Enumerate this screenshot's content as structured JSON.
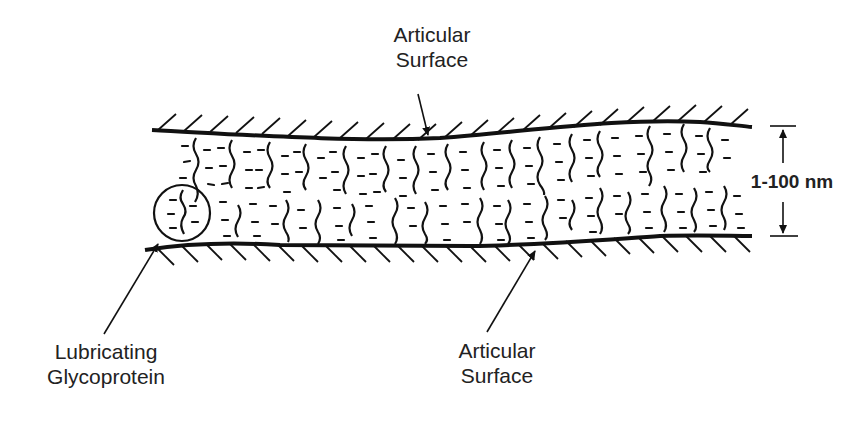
{
  "diagram": {
    "type": "schematic cross-section",
    "labels": {
      "top_surface": {
        "line1": "Articular",
        "line2": "Surface"
      },
      "bottom_surface": {
        "line1": "Articular",
        "line2": "Surface"
      },
      "glycoprotein": {
        "line1": "Lubricating",
        "line2": "Glycoprotein"
      },
      "thickness": "1-100 nm"
    },
    "colors": {
      "ink": "#111111",
      "background": "#ffffff"
    }
  }
}
